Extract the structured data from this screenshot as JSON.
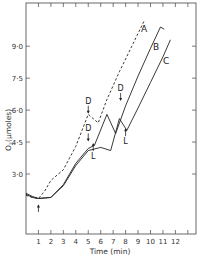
{
  "chart_data": {
    "type": "line",
    "title": "",
    "xlabel": "Time (min)",
    "ylabel": "O2 (µmoles)",
    "xlim": [
      0,
      13
    ],
    "ylim": [
      1.8,
      10.6
    ],
    "x_ticks": [
      1,
      2,
      3,
      4,
      5,
      6,
      7,
      8,
      9,
      10,
      11,
      12
    ],
    "y_ticks": [
      3.0,
      4.5,
      6.0,
      7.5,
      9.0
    ],
    "y_tick_labels": [
      "3·0",
      "4·5",
      "6·0",
      "7·5",
      "9·0"
    ],
    "grid": false,
    "legend_position": "inline labels at curve ends",
    "series": [
      {
        "name": "A",
        "style": "dashed",
        "points": [
          [
            0,
            2.0
          ],
          [
            0.5,
            1.9
          ],
          [
            1.0,
            1.85
          ],
          [
            1.5,
            2.2
          ],
          [
            2.0,
            2.7
          ],
          [
            3.0,
            3.2
          ],
          [
            4.0,
            4.3
          ],
          [
            5.0,
            5.8
          ],
          [
            5.8,
            5.4
          ],
          [
            6.5,
            6.5
          ],
          [
            7.5,
            7.8
          ],
          [
            8.5,
            9.0
          ],
          [
            9.5,
            10.2
          ]
        ]
      },
      {
        "name": "B",
        "style": "solid",
        "points": [
          [
            0,
            2.1
          ],
          [
            0.5,
            1.95
          ],
          [
            1.0,
            1.85
          ],
          [
            2.0,
            1.9
          ],
          [
            3.0,
            2.5
          ],
          [
            4.0,
            3.5
          ],
          [
            5.0,
            4.2
          ],
          [
            5.5,
            4.35
          ],
          [
            6.5,
            5.8
          ],
          [
            7.2,
            4.9
          ],
          [
            8.0,
            6.2
          ],
          [
            9.0,
            7.6
          ],
          [
            10.0,
            8.9
          ],
          [
            10.8,
            9.9
          ],
          [
            11.1,
            9.8
          ]
        ]
      },
      {
        "name": "C",
        "style": "solid",
        "points": [
          [
            0,
            2.05
          ],
          [
            0.5,
            1.9
          ],
          [
            1.0,
            1.85
          ],
          [
            2.0,
            1.9
          ],
          [
            3.0,
            2.45
          ],
          [
            4.0,
            3.4
          ],
          [
            5.0,
            4.1
          ],
          [
            6.0,
            4.25
          ],
          [
            6.8,
            4.1
          ],
          [
            7.5,
            5.6
          ],
          [
            8.1,
            5.05
          ],
          [
            9.0,
            6.1
          ],
          [
            10.0,
            7.3
          ],
          [
            11.0,
            8.5
          ],
          [
            11.6,
            9.3
          ]
        ]
      }
    ],
    "annotations": [
      {
        "text": "↑",
        "x": 1.0,
        "y": 1.5,
        "meaning": "start arrow"
      },
      {
        "text": "D",
        "x": 5.0,
        "y": 6.3,
        "arrow": "down"
      },
      {
        "text": "D",
        "x": 5.0,
        "y": 5.0,
        "arrow": "down"
      },
      {
        "text": "L",
        "x": 5.4,
        "y": 3.7,
        "arrow": "up"
      },
      {
        "text": "D",
        "x": 7.6,
        "y": 6.9,
        "arrow": "down"
      },
      {
        "text": "L",
        "x": 8.0,
        "y": 4.4,
        "arrow": "up"
      }
    ]
  }
}
